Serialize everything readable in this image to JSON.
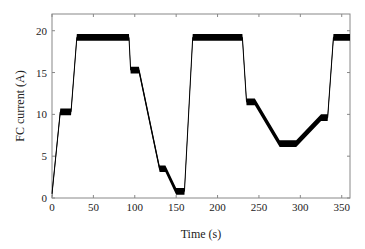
{
  "chart_data": {
    "type": "line",
    "title": "",
    "xlabel": "Time (s)",
    "ylabel": "FC current (A)",
    "xlim": [
      0,
      360
    ],
    "ylim": [
      0,
      22
    ],
    "xticks": [
      0,
      50,
      100,
      150,
      200,
      250,
      300,
      350
    ],
    "yticks": [
      0,
      5,
      10,
      15,
      20
    ],
    "grid": false,
    "legend": null,
    "series": [
      {
        "name": "FC current",
        "color": "#000000",
        "x": [
          0,
          10,
          23,
          30,
          93,
          95,
          105,
          130,
          137,
          150,
          160,
          170,
          230,
          235,
          245,
          275,
          295,
          325,
          333,
          340,
          360
        ],
        "y": [
          0.5,
          10.3,
          10.3,
          19.2,
          19.2,
          15.3,
          15.3,
          3.5,
          3.5,
          0.8,
          0.8,
          19.2,
          19.2,
          11.5,
          11.5,
          6.5,
          6.5,
          9.6,
          9.6,
          19.2,
          19.2
        ]
      }
    ],
    "plateau_ripple_band": 0.8
  }
}
